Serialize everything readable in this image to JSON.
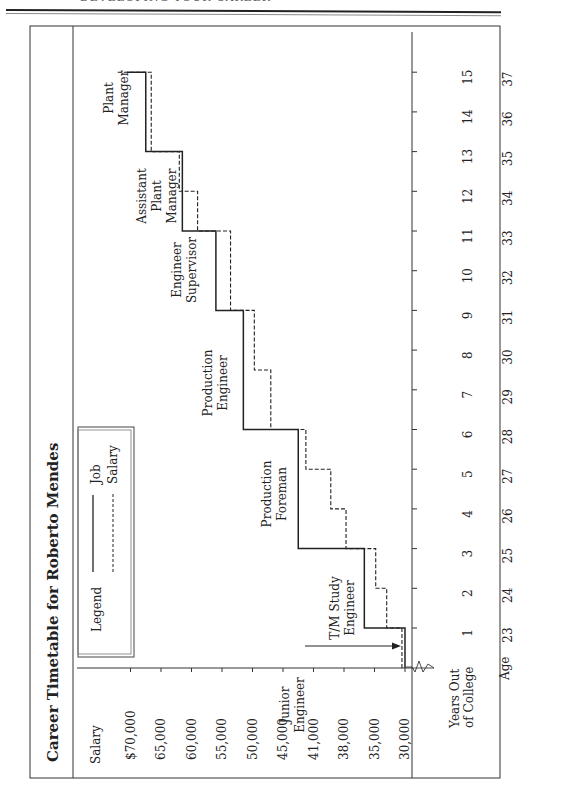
{
  "page_header": "DEVELOPING YOUR CAREER",
  "chart_data": {
    "type": "line",
    "subtype": "step",
    "orientation": "rotated-90-ccw",
    "title": "Career Timetable for Roberto Mendes",
    "ylabel": "Salary",
    "xlabel": "Years Out of College",
    "secondary_xlabel": "Age",
    "y_ticks": [
      "$70,000",
      "65,000",
      "60,000",
      "55,000",
      "50,000",
      "45,000",
      "41,000",
      "38,000",
      "35,000",
      "30,000"
    ],
    "y_tick_values": [
      70000,
      65000,
      60000,
      55000,
      50000,
      45000,
      41000,
      38000,
      35000,
      30000
    ],
    "x_ticks": [
      1,
      2,
      3,
      4,
      5,
      6,
      7,
      8,
      9,
      10,
      11,
      12,
      13,
      14,
      15
    ],
    "age_ticks": [
      23,
      24,
      25,
      26,
      27,
      28,
      29,
      30,
      31,
      32,
      33,
      34,
      35,
      36,
      37
    ],
    "axis_break": true,
    "legend": {
      "title": "Legend",
      "placement": "top-left",
      "entries": [
        {
          "name": "Job",
          "style": "solid"
        },
        {
          "name": "Salary",
          "style": "dashed"
        }
      ]
    },
    "series": [
      {
        "name": "Job",
        "style": "solid",
        "steps": [
          {
            "from_year": 0,
            "to_year": 1,
            "salary": 30000
          },
          {
            "from_year": 1,
            "to_year": 3,
            "salary": 36000
          },
          {
            "from_year": 3,
            "to_year": 6,
            "salary": 43000
          },
          {
            "from_year": 6,
            "to_year": 9,
            "salary": 51500
          },
          {
            "from_year": 9,
            "to_year": 11,
            "salary": 56000
          },
          {
            "from_year": 11,
            "to_year": 13,
            "salary": 61500
          },
          {
            "from_year": 13,
            "to_year": 15,
            "salary": 67500
          }
        ]
      },
      {
        "name": "Salary",
        "style": "dashed",
        "steps": [
          {
            "from_year": 0,
            "to_year": 1,
            "salary": 30500
          },
          {
            "from_year": 1,
            "to_year": 2,
            "salary": 33000
          },
          {
            "from_year": 2,
            "to_year": 3,
            "salary": 34800
          },
          {
            "from_year": 3,
            "to_year": 4,
            "salary": 37800
          },
          {
            "from_year": 4,
            "to_year": 5,
            "salary": 39300
          },
          {
            "from_year": 5,
            "to_year": 6,
            "salary": 42000
          },
          {
            "from_year": 6,
            "to_year": 7.5,
            "salary": 47000
          },
          {
            "from_year": 7.5,
            "to_year": 9,
            "salary": 49700
          },
          {
            "from_year": 9,
            "to_year": 11,
            "salary": 53600
          },
          {
            "from_year": 11,
            "to_year": 12,
            "salary": 59000
          },
          {
            "from_year": 12,
            "to_year": 13,
            "salary": 62000
          },
          {
            "from_year": 13,
            "to_year": 15,
            "salary": 66600
          }
        ]
      }
    ],
    "annotations": [
      {
        "lines": [
          "Junior",
          "Engineer"
        ],
        "year": 0.6,
        "arrow": true
      },
      {
        "lines": [
          "T/M Study",
          "Engineer"
        ],
        "year": 2
      },
      {
        "lines": [
          "Production",
          "Foreman"
        ],
        "year": 4.5
      },
      {
        "lines": [
          "Production",
          "Engineer"
        ],
        "year": 7.6
      },
      {
        "lines": [
          "Engineer",
          "Supervisor"
        ],
        "year": 10
      },
      {
        "lines": [
          "Assistant",
          "Plant",
          "Manager"
        ],
        "year": 12
      },
      {
        "lines": [
          "Plant",
          "Manager"
        ],
        "year": 14.2
      }
    ]
  }
}
